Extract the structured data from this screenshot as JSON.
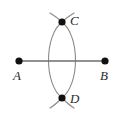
{
  "figure": {
    "background_color": "#ffffff",
    "width": 123,
    "height": 117,
    "line_color": "#6e6e6e",
    "arc_color": "#8a8a8a",
    "dot_color": "#111111",
    "label_color": "#2b2b2b",
    "segment": {
      "name": "AB",
      "x1": 19,
      "y1": 61,
      "x2": 105,
      "y2": 61,
      "stroke_width": 1.4
    },
    "points": [
      {
        "id": "A",
        "label": "A",
        "x": 19,
        "y": 61,
        "radius": 3.6,
        "label_x": 13,
        "label_y": 69
      },
      {
        "id": "B",
        "label": "B",
        "x": 105,
        "y": 61,
        "radius": 3.6,
        "label_x": 100,
        "label_y": 69
      },
      {
        "id": "C",
        "label": "C",
        "x": 62,
        "y": 22,
        "radius": 3.6,
        "label_x": 70,
        "label_y": 14
      },
      {
        "id": "D",
        "label": "D",
        "x": 62,
        "y": 98,
        "radius": 3.6,
        "label_x": 70,
        "label_y": 92
      }
    ],
    "arcs": [
      {
        "id": "arc-left",
        "center": "A",
        "description": "arc centered at A through C and D",
        "path": "M 62 22 C 44 36 44 84 62 98"
      },
      {
        "id": "arc-right",
        "center": "B",
        "description": "arc centered at B through C and D",
        "path": "M 62 22 C 80 36 80 84 62 98"
      }
    ],
    "cross_marks": [
      {
        "id": "cross-at-C",
        "at": "C",
        "description": "compass arc crossing marks above point C",
        "strokes": [
          {
            "path": "M 50 13 C 55 16 59 19 62 22"
          },
          {
            "path": "M 74 13 C 69 16 65 19 62 22"
          }
        ]
      },
      {
        "id": "cross-at-D",
        "at": "D",
        "description": "compass arc crossing marks below point D",
        "strokes": [
          {
            "path": "M 50 108 C 55 105 59 101 62 98"
          },
          {
            "path": "M 74 108 C 69 105 65 101 62 98"
          }
        ]
      }
    ]
  }
}
